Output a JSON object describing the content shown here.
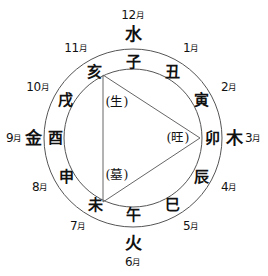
{
  "diagram": {
    "type": "circular-zodiac-chart",
    "colors": {
      "stroke": "#555555",
      "text": "#111111",
      "background": "#ffffff"
    },
    "geometry": {
      "center_x": 133,
      "center_y": 138,
      "outer_radius": 89,
      "inner_radius": 69,
      "triangle_vertices": "亥-卯-未"
    },
    "elements": [
      {
        "name": "water",
        "label": "水",
        "position": "top"
      },
      {
        "name": "wood",
        "label": "木",
        "position": "right"
      },
      {
        "name": "fire",
        "label": "火",
        "position": "bottom"
      },
      {
        "name": "metal",
        "label": "金",
        "position": "left"
      }
    ],
    "months": [
      {
        "key": "m1",
        "number": "1",
        "label": "1月",
        "suffix": "月",
        "branch": "丑"
      },
      {
        "key": "m2",
        "number": "2",
        "label": "2月",
        "suffix": "月",
        "branch": "寅"
      },
      {
        "key": "m3",
        "number": "3",
        "label": "3月",
        "suffix": "月",
        "branch": "卯"
      },
      {
        "key": "m4",
        "number": "4",
        "label": "4月",
        "suffix": "月",
        "branch": "辰"
      },
      {
        "key": "m5",
        "number": "5",
        "label": "5月",
        "suffix": "月",
        "branch": "巳"
      },
      {
        "key": "m6",
        "number": "6",
        "label": "6月",
        "suffix": "月",
        "branch": "午"
      },
      {
        "key": "m7",
        "number": "7",
        "label": "7月",
        "suffix": "月",
        "branch": "未"
      },
      {
        "key": "m8",
        "number": "8",
        "label": "8月",
        "suffix": "月",
        "branch": "申"
      },
      {
        "key": "m9",
        "number": "9",
        "label": "9月",
        "suffix": "月",
        "branch": "酉"
      },
      {
        "key": "m10",
        "number": "10",
        "label": "10月",
        "suffix": "月",
        "branch": "戌"
      },
      {
        "key": "m11",
        "number": "11",
        "label": "11月",
        "suffix": "月",
        "branch": "亥"
      },
      {
        "key": "m12",
        "number": "12",
        "label": "12月",
        "suffix": "月",
        "branch": "子"
      }
    ],
    "branches": {
      "zi": "子",
      "chou": "丑",
      "yin": "寅",
      "mao": "卯",
      "chen": "辰",
      "si": "巳",
      "wu": "午",
      "wei": "未",
      "shen": "申",
      "you": "酉",
      "xu": "戌",
      "hai": "亥"
    },
    "stages": [
      {
        "key": "sheng",
        "label": "(生)",
        "vertex": "亥"
      },
      {
        "key": "wang",
        "label": "(旺)",
        "vertex": "卯"
      },
      {
        "key": "mu",
        "label": "(墓)",
        "vertex": "未"
      }
    ],
    "month_numbers": {
      "m1": "1",
      "m2": "2",
      "m3": "3",
      "m4": "4",
      "m5": "5",
      "m6": "6",
      "m7": "7",
      "m8": "8",
      "m9": "9",
      "m10": "10",
      "m11": "11",
      "m12": "12"
    },
    "month_labels": {
      "m1": "1月",
      "m2": "2月",
      "m3": "3月",
      "m4": "4月",
      "m5": "5月",
      "m6": "6月",
      "m7": "7月",
      "m8": "8月",
      "m9": "9月",
      "m10": "10月",
      "m11": "11月",
      "m12": "12月"
    },
    "element_labels": {
      "water": "水",
      "wood": "木",
      "fire": "火",
      "metal": "金"
    },
    "stage_labels": {
      "sheng": "(生)",
      "wang": "(旺)",
      "mu": "(墓)"
    }
  }
}
